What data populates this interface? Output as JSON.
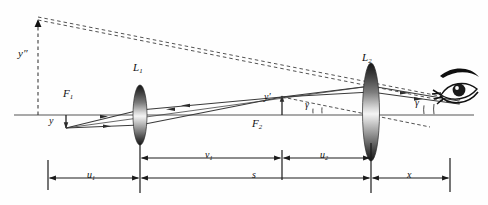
{
  "figure": {
    "type": "optical-ray-diagram",
    "width": 488,
    "height": 205,
    "background_color": "#fefefe",
    "axis_color": "#8c8c8c",
    "ray_color": "#3a3a3a",
    "dash_color": "#444444",
    "label_color": "#111111"
  },
  "labels": {
    "lens1": "L",
    "lens1_sub": "1",
    "lens2": "L",
    "lens2_sub": "2",
    "focus1": "F",
    "focus1_sub": "1",
    "focus2": "F",
    "focus2_sub": "2",
    "object_height": "y",
    "image1_height": "y′",
    "final_image_height": "y″",
    "angle_left": "γ",
    "angle_right": "γ"
  },
  "dimensions": [
    {
      "name": "u1",
      "text": "u",
      "sub": "1",
      "row": "lower",
      "x_start": 48,
      "x_end": 140
    },
    {
      "name": "v1",
      "text": "v",
      "sub": "1",
      "row": "upper",
      "x_start": 140,
      "x_end": 282
    },
    {
      "name": "u2",
      "text": "u",
      "sub": "2",
      "row": "upper",
      "x_start": 282,
      "x_end": 371
    },
    {
      "name": "s",
      "text": "s",
      "sub": "",
      "row": "lower",
      "x_start": 140,
      "x_end": 371
    },
    {
      "name": "x",
      "text": "x",
      "sub": "",
      "row": "lower",
      "x_start": 371,
      "x_end": 450
    }
  ],
  "optics": {
    "axis_y": 115,
    "lens1_x": 140,
    "lens1_ry": 30,
    "lens1_rx": 7,
    "lens2_x": 371,
    "lens2_ry": 49,
    "lens2_rx": 8,
    "focus1_x": 72,
    "focus2_x": 282,
    "object_x": 66,
    "object_y_tip": 128,
    "image1_x": 282,
    "image1_y_tip": 97,
    "final_image_x": 38,
    "final_image_y_tip": 14,
    "eye_x": 460,
    "eye_y": 93
  }
}
